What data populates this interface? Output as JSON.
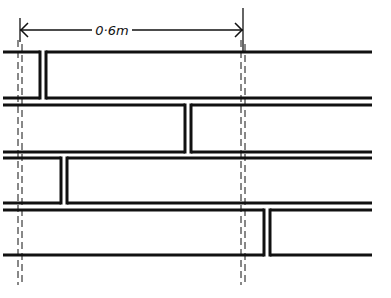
{
  "diagram": {
    "dimension": {
      "label": "0·6m",
      "from_x": 20,
      "to_x": 243,
      "y": 30
    },
    "colors": {
      "line": "#111111",
      "background": "#ffffff"
    },
    "boards": [
      {
        "index": 1,
        "top": 52,
        "bottom": 98,
        "joint_x": 43
      },
      {
        "index": 2,
        "top": 105,
        "bottom": 152,
        "joint_x": 188
      },
      {
        "index": 3,
        "top": 158,
        "bottom": 203,
        "joint_x": 64
      },
      {
        "index": 4,
        "top": 210,
        "bottom": 255,
        "joint_x": 267
      }
    ],
    "guide_lines": [
      {
        "name": "left-support",
        "x": 20
      },
      {
        "name": "right-support",
        "x": 243
      }
    ]
  }
}
